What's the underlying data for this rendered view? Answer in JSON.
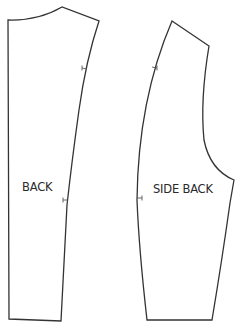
{
  "diagram": {
    "type": "sewing-pattern",
    "stroke_color": "#333333",
    "background": "#ffffff",
    "pieces": [
      {
        "id": "back",
        "label": "BACK",
        "notches": 2
      },
      {
        "id": "side-back",
        "label": "SIDE BACK",
        "notches": 2
      }
    ]
  }
}
